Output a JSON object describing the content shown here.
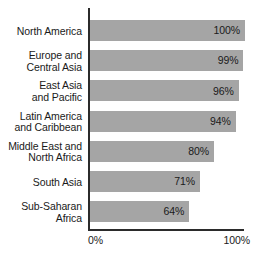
{
  "chart_data": {
    "type": "bar",
    "orientation": "horizontal",
    "title": "",
    "subtitle": "",
    "xlabel": "",
    "ylabel": "",
    "xlim": [
      0,
      100
    ],
    "grid": false,
    "legend": false,
    "xtick_labels": [
      "0%",
      "100%"
    ],
    "categories": [
      "North America",
      "Europe and\nCentral Asia",
      "East Asia\nand Pacific",
      "Latin America\nand Caribbean",
      "Middle East and\nNorth Africa",
      "South Asia",
      "Sub-Saharan\nAfrica"
    ],
    "values": [
      100,
      99,
      96,
      94,
      80,
      71,
      64
    ],
    "value_labels": [
      "100%",
      "99%",
      "96%",
      "94%",
      "80%",
      "71%",
      "64%"
    ],
    "bar_color": "#a5a5a5",
    "axis_color": "#2b2b2b",
    "text_color": "#1a1a1a",
    "background_color": "#ffffff"
  }
}
